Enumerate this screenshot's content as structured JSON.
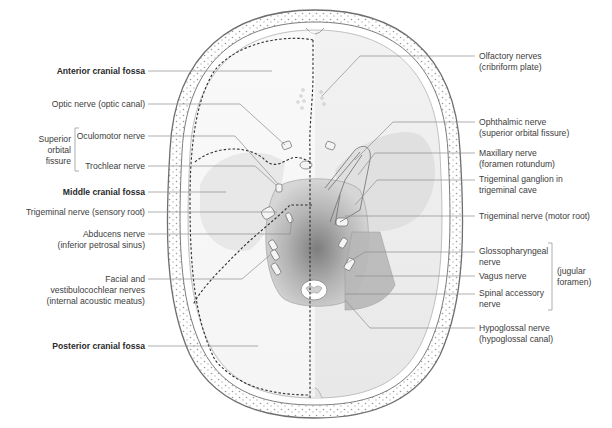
{
  "figure": {
    "left_labels": {
      "anterior_fossa": "Anterior cranial fossa",
      "optic": "Optic nerve (optic canal)",
      "sof_group_1": "Superior",
      "sof_group_2": "orbital",
      "sof_group_3": "fissure",
      "oculomotor": "Oculomotor nerve",
      "trochlear": "Trochlear nerve",
      "middle_fossa": "Middle cranial fossa",
      "trigeminal_sensory": "Trigeminal nerve (sensory root)",
      "abducens_1": "Abducens nerve",
      "abducens_2": "(inferior petrosal sinus)",
      "facial_1": "Facial and",
      "facial_2": "vestibulocochlear nerves",
      "facial_3": "(internal acoustic meatus)",
      "posterior_fossa": "Posterior cranial fossa"
    },
    "right_labels": {
      "olfactory_1": "Olfactory nerves",
      "olfactory_2": "(cribriform plate)",
      "ophthalmic_1": "Ophthalmic nerve",
      "ophthalmic_2": "(superior orbital fissure)",
      "maxillary_1": "Maxillary nerve",
      "maxillary_2": "(foramen rotundum)",
      "ganglion_1": "Trigeminal ganglion in",
      "ganglion_2": "trigeminal cave",
      "trigeminal_motor": "Trigeminal nerve (motor root)",
      "glosso_1": "Glossopharyngeal",
      "glosso_2": "nerve",
      "vagus": "Vagus nerve",
      "accessory_1": "Spinal accessory",
      "accessory_2": "nerve",
      "jugular_1": "(jugular",
      "jugular_2": "foramen)",
      "hypoglossal_1": "Hypoglossal nerve",
      "hypoglossal_2": "(hypoglossal canal)"
    },
    "colors": {
      "bone_outline": "#6e6e6e",
      "fossa_fill": "#ececec",
      "shade_dark": "#8a8a8a",
      "leader_line": "#8c8c8c",
      "dashed_line": "#2e2e2e"
    }
  }
}
